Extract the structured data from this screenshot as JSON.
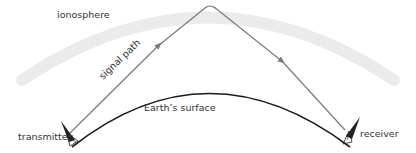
{
  "diagram": {
    "labels": {
      "ionosphere": "ionosphere",
      "signal_path": "signal path",
      "earth_surface": "Earth’s surface",
      "transmitter": "transmitter",
      "receiver": "receiver"
    },
    "colors": {
      "ionosphere_band": "#ebebeb",
      "signal_path": "#7a7a7a",
      "earth_surface": "#1a1a1a",
      "text": "#333333",
      "background": "#ffffff"
    }
  }
}
